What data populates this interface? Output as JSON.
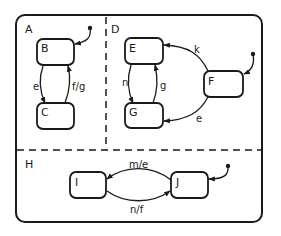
{
  "diagram": {
    "type": "statechart",
    "ink_color": "#1a1a1a",
    "background": "#ffffff",
    "regions": [
      {
        "id": "A",
        "label": "A"
      },
      {
        "id": "D",
        "label": "D"
      },
      {
        "id": "H",
        "label": "H"
      }
    ],
    "states": [
      {
        "id": "B",
        "label": "B",
        "region": "A",
        "initial": true
      },
      {
        "id": "C",
        "label": "C",
        "region": "A"
      },
      {
        "id": "E",
        "label": "E",
        "region": "D"
      },
      {
        "id": "F",
        "label": "F",
        "region": "D",
        "initial": true
      },
      {
        "id": "G",
        "label": "G",
        "region": "D"
      },
      {
        "id": "I",
        "label": "I",
        "region": "H"
      },
      {
        "id": "J",
        "label": "J",
        "region": "H",
        "initial": true
      }
    ],
    "transitions": [
      {
        "from": "B",
        "to": "C",
        "label": "e"
      },
      {
        "from": "C",
        "to": "B",
        "label": "f/g"
      },
      {
        "from": "E",
        "to": "G",
        "label": "n"
      },
      {
        "from": "G",
        "to": "E",
        "label": "g"
      },
      {
        "from": "F",
        "to": "E",
        "label": "k"
      },
      {
        "from": "F",
        "to": "G",
        "label": "e"
      },
      {
        "from": "J",
        "to": "I",
        "label": "m/e"
      },
      {
        "from": "I",
        "to": "J",
        "label": "n/f"
      }
    ]
  }
}
